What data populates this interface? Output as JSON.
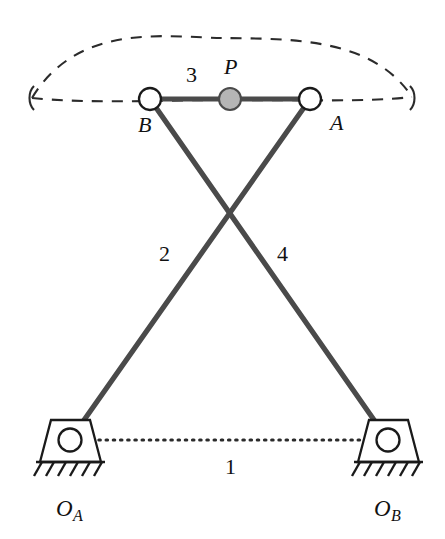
{
  "figure": {
    "type": "kinematic-linkage-diagram",
    "width": 445,
    "height": 539,
    "background": "#ffffff",
    "link_color": "#4a4a4a",
    "outline_color": "#1a1a1a",
    "joint_fill": "#ffffff",
    "coupler_point_fill": "#b5b5b5",
    "curve_color": "#2b2b2b"
  },
  "labels": {
    "point_a": "A",
    "point_b": "B",
    "point_p": "P",
    "ground_a_letter": "O",
    "ground_a_sub": "A",
    "ground_b_letter": "O",
    "ground_b_sub": "B",
    "link1": "1",
    "link2": "2",
    "link3": "3",
    "link4": "4"
  },
  "joints": [
    {
      "name": "B",
      "x": 150,
      "y": 99,
      "r": 11,
      "style": "open-pin",
      "label": "B"
    },
    {
      "name": "P",
      "x": 230,
      "y": 99,
      "r": 11,
      "style": "filled-gray",
      "label": "P"
    },
    {
      "name": "A",
      "x": 310,
      "y": 99,
      "r": 11,
      "style": "open-pin",
      "label": "A"
    },
    {
      "name": "OA",
      "x": 70,
      "y": 440,
      "r": 11,
      "style": "open-pin",
      "label": "O_A"
    },
    {
      "name": "OB",
      "x": 388,
      "y": 440,
      "r": 11,
      "style": "open-pin",
      "label": "O_B"
    }
  ],
  "links": [
    {
      "id": "1",
      "from": "OA",
      "to": "OB",
      "style": "dotted",
      "role": "ground-link"
    },
    {
      "id": "2",
      "from": "OA",
      "to": "A",
      "style": "solid",
      "role": "crank"
    },
    {
      "id": "3",
      "from": "B",
      "to": "A",
      "style": "solid",
      "role": "coupler"
    },
    {
      "id": "4",
      "from": "OB",
      "to": "B",
      "style": "solid",
      "role": "rocker"
    }
  ],
  "coupler_curve": {
    "style": "dashed",
    "closed": true,
    "left_tip_x": 32,
    "right_tip_x": 412,
    "baseline_y": 98,
    "apex_y": 38
  },
  "supports": [
    {
      "name": "ground-support-left",
      "pivot_x": 70,
      "hatch_count": 6
    },
    {
      "name": "ground-support-right",
      "pivot_x": 388,
      "hatch_count": 6
    }
  ]
}
